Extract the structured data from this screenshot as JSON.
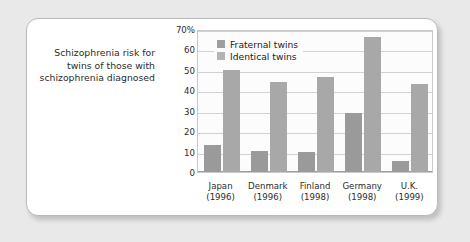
{
  "caption": {
    "text": "Schizophrenia risk for twins of those with schizophrenia diagnosed"
  },
  "colors": {
    "fraternal": "#9a9a9a",
    "identical": "#a8a8a8",
    "legend_fraternal_swatch": "#9e9e9e",
    "legend_identical_swatch": "#b4b4b4",
    "plot_background": "#fcfcfc",
    "gridline": "#d2d2d2",
    "card_background": "#ffffff",
    "page_background": "#e9e9e9",
    "border": "#b9b9b9",
    "text": "#2b2b2b"
  },
  "chart_data": {
    "type": "bar",
    "title": "",
    "xlabel": "",
    "ylabel": "",
    "ylim": [
      0,
      70
    ],
    "yticks": [
      0,
      10,
      20,
      30,
      40,
      50,
      60,
      70
    ],
    "ytick_labels": [
      "0",
      "10",
      "20",
      "30",
      "40",
      "50",
      "60",
      "70%"
    ],
    "grid": true,
    "legend_position": "top-left inside plot",
    "categories": [
      "Japan",
      "Denmark",
      "Finland",
      "Germany",
      "U.K."
    ],
    "category_years": [
      "(1996)",
      "(1996)",
      "(1998)",
      "(1998)",
      "(1999)"
    ],
    "series": [
      {
        "name": "Fraternal twins",
        "values": [
          13,
          10.5,
          10,
          29,
          5.5
        ]
      },
      {
        "name": "Identical twins",
        "values": [
          50,
          44,
          46.5,
          66,
          43
        ]
      }
    ]
  }
}
